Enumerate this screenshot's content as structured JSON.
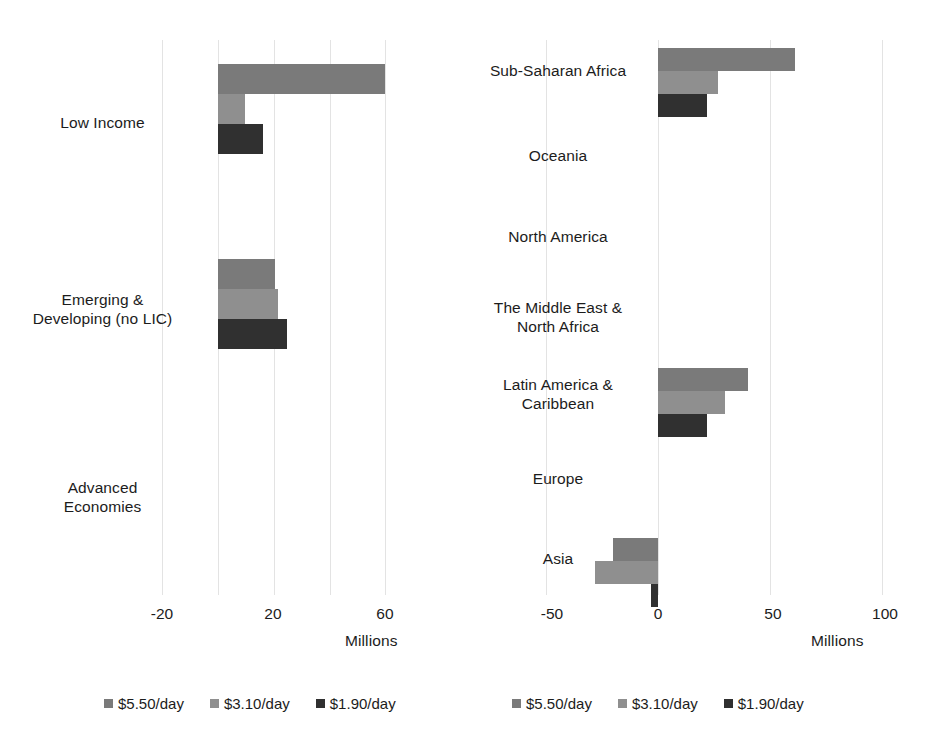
{
  "chart_data": [
    {
      "type": "bar",
      "orientation": "horizontal",
      "title": "",
      "xlabel": "Millions",
      "ylabel": "",
      "xlim": [
        -20,
        68
      ],
      "xticks": [
        -20,
        20,
        60
      ],
      "gridlines": [
        -20,
        0,
        20,
        40,
        60
      ],
      "grid": true,
      "legend_position": "bottom",
      "categories": [
        "Low Income",
        "Emerging &\nDeveloping (no LIC)",
        "Advanced\nEconomies"
      ],
      "series": [
        {
          "name": "$5.50/day",
          "color": "#7a7a7a",
          "values": [
            60.0,
            20.5,
            0
          ]
        },
        {
          "name": "$3.10/day",
          "color": "#8f8f8f",
          "values": [
            9.7,
            21.5,
            0
          ]
        },
        {
          "name": "$1.90/day",
          "color": "#303030",
          "values": [
            16.0,
            24.7,
            0
          ]
        }
      ]
    },
    {
      "type": "bar",
      "orientation": "horizontal",
      "title": "",
      "xlabel": "Millions",
      "ylabel": "",
      "xlim": [
        -50,
        108
      ],
      "xticks": [
        -50,
        0,
        50,
        100
      ],
      "gridlines": [
        -50,
        0,
        50,
        100
      ],
      "grid": true,
      "legend_position": "bottom",
      "categories": [
        "Sub-Saharan Africa",
        "Oceania",
        "North America",
        "The Middle East &\nNorth Africa",
        "Latin America &\nCaribbean",
        "Europe",
        "Asia"
      ],
      "series": [
        {
          "name": "$5.50/day",
          "color": "#7a7a7a",
          "values": [
            61.0,
            0,
            0,
            0,
            40.0,
            0,
            -20.0
          ]
        },
        {
          "name": "$3.10/day",
          "color": "#8f8f8f",
          "values": [
            27.0,
            0,
            0,
            0,
            30.0,
            0,
            -28.0
          ]
        },
        {
          "name": "$1.90/day",
          "color": "#303030",
          "values": [
            22.0,
            0,
            0,
            0,
            22.0,
            0,
            -3.0
          ]
        }
      ]
    }
  ],
  "left_chart": {
    "axis_title": "Millions",
    "tick_labels": [
      "-20",
      "20",
      "60"
    ],
    "categories": [
      {
        "label": "Low Income"
      },
      {
        "label": "Emerging &\nDeveloping (no LIC)"
      },
      {
        "label": "Advanced\nEconomies"
      }
    ],
    "legend": [
      {
        "label": "$5.50/day",
        "color": "#7a7a7a"
      },
      {
        "label": "$3.10/day",
        "color": "#8f8f8f"
      },
      {
        "label": "$1.90/day",
        "color": "#303030"
      }
    ]
  },
  "right_chart": {
    "axis_title": "Millions",
    "tick_labels": [
      "-50",
      "0",
      "50",
      "100"
    ],
    "categories": [
      {
        "label": "Sub-Saharan Africa"
      },
      {
        "label": "Oceania"
      },
      {
        "label": "North America"
      },
      {
        "label": "The Middle East &\nNorth Africa"
      },
      {
        "label": "Latin America &\nCaribbean"
      },
      {
        "label": "Europe"
      },
      {
        "label": "Asia"
      }
    ],
    "legend": [
      {
        "label": "$5.50/day",
        "color": "#7a7a7a"
      },
      {
        "label": "$3.10/day",
        "color": "#8f8f8f"
      },
      {
        "label": "$1.90/day",
        "color": "#303030"
      }
    ]
  }
}
